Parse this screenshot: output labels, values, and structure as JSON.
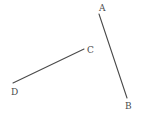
{
  "figure": {
    "canvas": {
      "width": 150,
      "height": 125,
      "background_color": "#ffffff"
    },
    "style": {
      "stroke_color": "#4a4a4a",
      "stroke_width": 1.1,
      "label_color": "#4a4a4a",
      "label_font_size": 9
    },
    "points": [
      {
        "id": "A",
        "label": "A",
        "x": 99,
        "y": 14,
        "label_x": 99,
        "label_y": 4
      },
      {
        "id": "B",
        "label": "B",
        "x": 127,
        "y": 98,
        "label_x": 125,
        "label_y": 102
      },
      {
        "id": "C",
        "label": "C",
        "x": 84,
        "y": 49,
        "label_x": 87,
        "label_y": 46
      },
      {
        "id": "D",
        "label": "D",
        "x": 13,
        "y": 83,
        "label_x": 11,
        "label_y": 88
      }
    ],
    "segments": [
      {
        "id": "AB",
        "from": "A",
        "to": "B",
        "x1": 99,
        "y1": 14,
        "x2": 127,
        "y2": 98
      },
      {
        "id": "CD",
        "from": "C",
        "to": "D",
        "x1": 84,
        "y1": 49,
        "x2": 13,
        "y2": 83
      }
    ]
  }
}
